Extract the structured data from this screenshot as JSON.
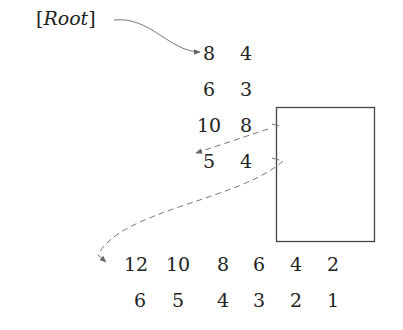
{
  "root_label": {
    "open": "[",
    "text": "Root",
    "close": "]"
  },
  "nodes": [
    {
      "id": "node-1",
      "rows": [
        [
          "8",
          "4"
        ],
        [
          "6",
          "3"
        ]
      ]
    },
    {
      "id": "node-2",
      "rows": [
        [
          "10",
          "8"
        ],
        [
          "5",
          "4"
        ]
      ]
    },
    {
      "id": "node-3",
      "rows": [
        [
          "12",
          "10",
          "8",
          "6",
          "4",
          "2"
        ],
        [
          "6",
          "5",
          "4",
          "3",
          "2",
          "1"
        ]
      ]
    }
  ],
  "colors": {
    "text": "#222222",
    "arrow": "#666666",
    "box": "#444444"
  }
}
